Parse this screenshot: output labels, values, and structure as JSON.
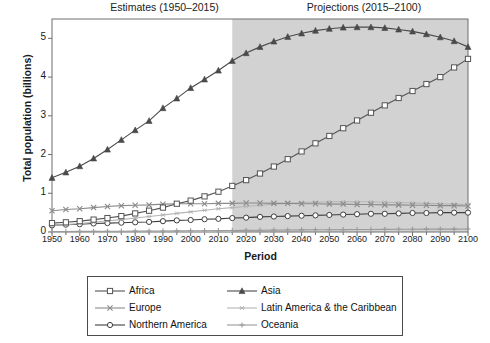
{
  "headers": {
    "estimates": "Estimates (1950–2015)",
    "projections": "Projections (2015–2100)"
  },
  "axes": {
    "xlabel": "Period",
    "ylabel": "Total population (billions)"
  },
  "colors": {
    "africa": "#555555",
    "asia": "#4a4a4a",
    "europe": "#8a8a8a",
    "latin_america": "#b5b5b5",
    "northern_america": "#3f3f3f",
    "oceania": "#9a9a9a",
    "shaded_region": "#d2d2d2",
    "frame": "#6e6e6e"
  },
  "legend": {
    "items": [
      {
        "label": "Africa",
        "marker": "square",
        "color": "#555555"
      },
      {
        "label": "Asia",
        "marker": "triangle",
        "color": "#4a4a4a"
      },
      {
        "label": "Europe",
        "marker": "cross",
        "color": "#8a8a8a"
      },
      {
        "label": "Latin America & the Caribbean",
        "marker": "asterisk",
        "color": "#b5b5b5"
      },
      {
        "label": "Northern America",
        "marker": "circle",
        "color": "#3f3f3f"
      },
      {
        "label": "Oceania",
        "marker": "plus",
        "color": "#9a9a9a"
      }
    ]
  },
  "chart_data": {
    "type": "line",
    "title": "",
    "xlabel": "Period",
    "ylabel": "Total population (billions)",
    "xlim": [
      1950,
      2100
    ],
    "ylim": [
      0,
      5.5
    ],
    "yticks": [
      0,
      1,
      2,
      3,
      4,
      5
    ],
    "xticks": [
      1950,
      1960,
      1970,
      1980,
      1990,
      2000,
      2010,
      2020,
      2030,
      2040,
      2050,
      2060,
      2070,
      2080,
      2090,
      2100
    ],
    "grid": false,
    "legend_position": "below",
    "shaded_region": {
      "from": 2015,
      "to": 2100,
      "label": "Projections (2015–2100)"
    },
    "estimates_region": {
      "from": 1950,
      "to": 2015,
      "label": "Estimates (1950–2015)"
    },
    "x": [
      1950,
      1955,
      1960,
      1965,
      1970,
      1975,
      1980,
      1985,
      1990,
      1995,
      2000,
      2005,
      2010,
      2015,
      2020,
      2025,
      2030,
      2035,
      2040,
      2045,
      2050,
      2055,
      2060,
      2065,
      2070,
      2075,
      2080,
      2085,
      2090,
      2095,
      2100
    ],
    "series": [
      {
        "name": "Africa",
        "marker": "square",
        "color": "#555555",
        "values": [
          0.23,
          0.25,
          0.28,
          0.32,
          0.36,
          0.41,
          0.48,
          0.55,
          0.63,
          0.73,
          0.81,
          0.92,
          1.04,
          1.19,
          1.34,
          1.51,
          1.69,
          1.88,
          2.08,
          2.29,
          2.48,
          2.68,
          2.88,
          3.08,
          3.27,
          3.46,
          3.64,
          3.82,
          4.0,
          4.25,
          4.47
        ]
      },
      {
        "name": "Asia",
        "marker": "triangle",
        "color": "#4a4a4a",
        "values": [
          1.4,
          1.54,
          1.7,
          1.9,
          2.13,
          2.38,
          2.63,
          2.87,
          3.2,
          3.45,
          3.72,
          3.94,
          4.17,
          4.42,
          4.62,
          4.78,
          4.92,
          5.04,
          5.13,
          5.2,
          5.25,
          5.28,
          5.29,
          5.29,
          5.27,
          5.23,
          5.18,
          5.11,
          5.03,
          4.93,
          4.78
        ]
      },
      {
        "name": "Europe",
        "marker": "cross",
        "color": "#8a8a8a",
        "values": [
          0.55,
          0.58,
          0.6,
          0.63,
          0.66,
          0.68,
          0.69,
          0.7,
          0.72,
          0.73,
          0.73,
          0.73,
          0.74,
          0.74,
          0.75,
          0.75,
          0.74,
          0.74,
          0.73,
          0.73,
          0.72,
          0.72,
          0.71,
          0.71,
          0.7,
          0.7,
          0.69,
          0.69,
          0.68,
          0.68,
          0.67
        ]
      },
      {
        "name": "Latin America & the Caribbean",
        "marker": "asterisk",
        "color": "#b5b5b5",
        "values": [
          0.17,
          0.19,
          0.22,
          0.25,
          0.29,
          0.32,
          0.36,
          0.4,
          0.44,
          0.48,
          0.52,
          0.56,
          0.6,
          0.63,
          0.66,
          0.69,
          0.72,
          0.74,
          0.76,
          0.77,
          0.78,
          0.78,
          0.78,
          0.78,
          0.77,
          0.76,
          0.75,
          0.74,
          0.73,
          0.72,
          0.71
        ]
      },
      {
        "name": "Northern America",
        "marker": "circle",
        "color": "#3f3f3f",
        "values": [
          0.17,
          0.19,
          0.2,
          0.22,
          0.23,
          0.24,
          0.25,
          0.26,
          0.28,
          0.3,
          0.31,
          0.33,
          0.34,
          0.36,
          0.37,
          0.39,
          0.4,
          0.41,
          0.42,
          0.43,
          0.44,
          0.45,
          0.46,
          0.47,
          0.47,
          0.48,
          0.49,
          0.49,
          0.5,
          0.5,
          0.5
        ]
      },
      {
        "name": "Oceania",
        "marker": "plus",
        "color": "#9a9a9a",
        "values": [
          0.013,
          0.014,
          0.016,
          0.017,
          0.019,
          0.021,
          0.023,
          0.025,
          0.027,
          0.029,
          0.031,
          0.033,
          0.036,
          0.04,
          0.043,
          0.046,
          0.049,
          0.052,
          0.055,
          0.057,
          0.06,
          0.062,
          0.064,
          0.066,
          0.068,
          0.07,
          0.071,
          0.073,
          0.074,
          0.075,
          0.077
        ]
      }
    ]
  }
}
